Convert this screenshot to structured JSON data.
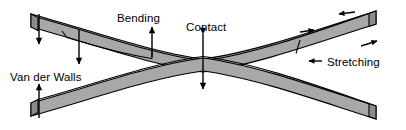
{
  "figure": {
    "colors": {
      "beam_fill": "#a8a8a8",
      "beam_cap_fill": "#8c8c8c",
      "outline": "#000000",
      "background": "#ffffff",
      "text": "#000000"
    },
    "labels": [
      {
        "id": "bending",
        "text": "Bending",
        "x": 117,
        "y": 13
      },
      {
        "id": "contact",
        "text": "Contact",
        "x": 186,
        "y": 22
      },
      {
        "id": "stretching",
        "text": "Stretching",
        "x": 327,
        "y": 57
      },
      {
        "id": "van_der_walls",
        "text": "Van der Walls",
        "x": 10,
        "y": 72
      }
    ],
    "annotations": [
      {
        "id": "bending-arrow",
        "kind": "arrow",
        "direction": "up",
        "label": "Bending"
      },
      {
        "id": "contact-arrow",
        "kind": "double-arrow",
        "direction": "vertical",
        "label": "Contact"
      },
      {
        "id": "van-der-walls-arrow",
        "kind": "arrow",
        "direction": "up",
        "label": "Van der Walls"
      },
      {
        "id": "left-tip-load-arrow",
        "kind": "arrow",
        "direction": "down",
        "label": ""
      },
      {
        "id": "left-mid-load-arrow",
        "kind": "arrow",
        "direction": "down",
        "label": ""
      },
      {
        "id": "stretch-upper-left",
        "kind": "arrow",
        "direction": "left",
        "label": "Stretching"
      },
      {
        "id": "stretch-upper-right",
        "kind": "arrow",
        "direction": "right",
        "label": "Stretching"
      },
      {
        "id": "stretch-lower-left",
        "kind": "arrow",
        "direction": "left",
        "label": "Stretching"
      },
      {
        "id": "stretch-lower-right",
        "kind": "arrow",
        "direction": "right",
        "label": "Stretching"
      }
    ],
    "beams": [
      {
        "id": "upper-beam",
        "description": "Upper curved beam, concave up, contacts lower beam at center"
      },
      {
        "id": "lower-beam",
        "description": "Lower curved beam, concave down, contacts upper beam at center"
      }
    ]
  }
}
